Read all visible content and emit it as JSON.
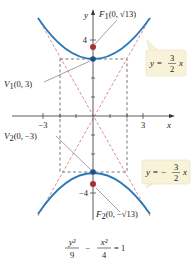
{
  "diagram": {
    "title_equation": {
      "numerator_left": "y²",
      "denominator_left": "9",
      "minus": "−",
      "numerator_right": "x²",
      "denominator_right": "4",
      "equals": "= 1"
    },
    "axes": {
      "x_label": "x",
      "y_label": "y",
      "x_ticks": [
        "−3",
        "3"
      ],
      "y_ticks": [
        "4",
        "−4"
      ]
    },
    "points": {
      "F1": {
        "name": "F",
        "sub": "1",
        "coords": "(0, √13)"
      },
      "F2": {
        "name": "F",
        "sub": "2",
        "coords": "(0, −√13)"
      },
      "V1": {
        "name": "V",
        "sub": "1",
        "coords": "(0, 3)"
      },
      "V2": {
        "name": "V",
        "sub": "2",
        "coords": "(0, −3)"
      }
    },
    "asymptotes": {
      "positive": {
        "lhs": "y =",
        "num": "3",
        "den": "2",
        "var": "x"
      },
      "negative": {
        "lhs": "y = −",
        "num": "3",
        "den": "2",
        "var": "x"
      }
    },
    "colors": {
      "curve": "#2a78b8",
      "asymptote": "#d07070",
      "box": "#555555",
      "focus": "#a83232",
      "vertex": "#1f4f8a",
      "callout_bg": "#f7f2d8"
    }
  }
}
